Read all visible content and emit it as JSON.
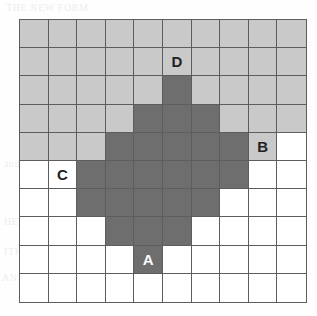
{
  "figure": {
    "grid": {
      "columns": 10,
      "rows": 10,
      "cell_width": 28.8,
      "cell_height": 28.4
    },
    "colors": {
      "dark_fill": "#6e6e6e",
      "light_fill": "#c9c9c9",
      "empty_fill": "#ffffff",
      "grid_line": "#5d5d5d",
      "label_on_dark": "#ffffff",
      "label_on_light": "#222222",
      "background": "#fefefe"
    },
    "legend": {
      "dark_meaning": "shaded region",
      "light_meaning": "secondary shaded region",
      "empty_meaning": "unshaded region"
    },
    "dark_cells": [
      {
        "row": 2,
        "col": 5
      },
      {
        "row": 3,
        "col": 4
      },
      {
        "row": 3,
        "col": 5
      },
      {
        "row": 3,
        "col": 6
      },
      {
        "row": 4,
        "col": 3
      },
      {
        "row": 4,
        "col": 4
      },
      {
        "row": 4,
        "col": 5
      },
      {
        "row": 4,
        "col": 6
      },
      {
        "row": 4,
        "col": 7
      },
      {
        "row": 5,
        "col": 2
      },
      {
        "row": 5,
        "col": 3
      },
      {
        "row": 5,
        "col": 4
      },
      {
        "row": 5,
        "col": 5
      },
      {
        "row": 5,
        "col": 6
      },
      {
        "row": 5,
        "col": 7
      },
      {
        "row": 6,
        "col": 2
      },
      {
        "row": 6,
        "col": 3
      },
      {
        "row": 6,
        "col": 4
      },
      {
        "row": 6,
        "col": 5
      },
      {
        "row": 6,
        "col": 6
      },
      {
        "row": 7,
        "col": 3
      },
      {
        "row": 7,
        "col": 4
      },
      {
        "row": 7,
        "col": 5
      },
      {
        "row": 8,
        "col": 4
      }
    ],
    "light_cells": [
      {
        "row": 0,
        "col": 0
      },
      {
        "row": 0,
        "col": 1
      },
      {
        "row": 0,
        "col": 2
      },
      {
        "row": 0,
        "col": 3
      },
      {
        "row": 0,
        "col": 4
      },
      {
        "row": 0,
        "col": 5
      },
      {
        "row": 0,
        "col": 6
      },
      {
        "row": 0,
        "col": 7
      },
      {
        "row": 0,
        "col": 8
      },
      {
        "row": 0,
        "col": 9
      },
      {
        "row": 1,
        "col": 0
      },
      {
        "row": 1,
        "col": 1
      },
      {
        "row": 1,
        "col": 2
      },
      {
        "row": 1,
        "col": 3
      },
      {
        "row": 1,
        "col": 4
      },
      {
        "row": 1,
        "col": 5
      },
      {
        "row": 1,
        "col": 6
      },
      {
        "row": 1,
        "col": 7
      },
      {
        "row": 1,
        "col": 8
      },
      {
        "row": 1,
        "col": 9
      },
      {
        "row": 2,
        "col": 0
      },
      {
        "row": 2,
        "col": 1
      },
      {
        "row": 2,
        "col": 2
      },
      {
        "row": 2,
        "col": 3
      },
      {
        "row": 2,
        "col": 4
      },
      {
        "row": 2,
        "col": 6
      },
      {
        "row": 2,
        "col": 7
      },
      {
        "row": 2,
        "col": 8
      },
      {
        "row": 2,
        "col": 9
      },
      {
        "row": 3,
        "col": 0
      },
      {
        "row": 3,
        "col": 1
      },
      {
        "row": 3,
        "col": 2
      },
      {
        "row": 3,
        "col": 3
      },
      {
        "row": 3,
        "col": 7
      },
      {
        "row": 3,
        "col": 8
      },
      {
        "row": 3,
        "col": 9
      },
      {
        "row": 4,
        "col": 0
      },
      {
        "row": 4,
        "col": 1
      },
      {
        "row": 4,
        "col": 2
      },
      {
        "row": 4,
        "col": 8
      }
    ],
    "labels": [
      {
        "text": "D",
        "row": 1,
        "col": 5,
        "on": "light"
      },
      {
        "text": "B",
        "row": 4,
        "col": 8,
        "on": "light"
      },
      {
        "text": "C",
        "row": 5,
        "col": 1,
        "on": "light"
      },
      {
        "text": "A",
        "row": 8,
        "col": 4,
        "on": "dark"
      }
    ]
  },
  "page_bleed": [
    {
      "text": "THE NEW FORM",
      "x": 6,
      "y": 2
    },
    {
      "text": "and give chance a",
      "x": 4,
      "y": 158
    },
    {
      "text": "HERE, OFF",
      "x": 4,
      "y": 216
    },
    {
      "text": "ITH",
      "x": 4,
      "y": 246
    },
    {
      "text": "AND FIVE CHOOSE",
      "x": 2,
      "y": 272
    },
    {
      "text": "FIVE THE",
      "x": 196,
      "y": 272
    },
    {
      "text": "IT SUCH",
      "x": 240,
      "y": 216
    },
    {
      "text": "NOT",
      "x": 272,
      "y": 186
    },
    {
      "text": "INK",
      "x": 278,
      "y": 246
    },
    {
      "text": "the",
      "x": 214,
      "y": 158
    }
  ]
}
